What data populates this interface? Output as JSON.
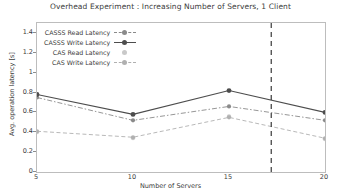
{
  "chart_data": {
    "type": "line",
    "title": "Overhead Experiment   : Increasing Number of Servers, 1 Client",
    "xlabel": "Number of Servers",
    "ylabel": "Avg. operation latency [s]",
    "x": [
      5,
      10,
      15,
      20
    ],
    "xlim": [
      5,
      20
    ],
    "ylim": [
      0,
      1.5
    ],
    "xticks": [
      5,
      10,
      15,
      20
    ],
    "xtick_labels": [
      "5",
      "10",
      "15",
      "20"
    ],
    "yticks": [
      0,
      0.2,
      0.4,
      0.6,
      0.8,
      1,
      1.2,
      1.4
    ],
    "ytick_labels": [
      "0",
      "0.2",
      "0.4",
      "0.6",
      "0.8",
      "1",
      "1.2",
      "1.4"
    ],
    "grid": false,
    "legend_position": "upper left",
    "series": [
      {
        "name": "CASSS Read Latency",
        "values": [
          0.75,
          0.52,
          0.66,
          0.52
        ],
        "color": "#8a8a8a",
        "linestyle": "dashdot",
        "marker": "circle"
      },
      {
        "name": "CASSS Write Latency",
        "values": [
          0.78,
          0.58,
          0.82,
          0.6
        ],
        "color": "#4d4d4d",
        "linestyle": "solid",
        "marker": "circle"
      },
      {
        "name": "CAS Read Latency",
        "values": [
          0.4,
          0.34,
          0.56,
          0.33
        ],
        "color": "#c9c9c9",
        "linestyle": "none",
        "marker": "circle"
      },
      {
        "name": "CAS Write Latency",
        "values": [
          0.41,
          0.35,
          0.55,
          0.34
        ],
        "color": "#b0b0b0",
        "linestyle": "dashed",
        "marker": "circle"
      }
    ],
    "annotations": [
      {
        "type": "vertical-line",
        "x": 17.2,
        "linestyle": "dashed",
        "color": "#3a3a3a"
      }
    ]
  }
}
